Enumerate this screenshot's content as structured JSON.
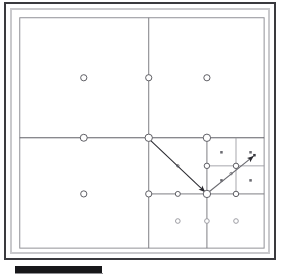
{
  "window": {
    "title": "Quadtree Mesh Refinement Viewer",
    "frame_color": "#3a3a3e",
    "inner_border_color": "#c9c9cc",
    "background_color": "#ffffff"
  },
  "scrollbar": {
    "orientation": "horizontal",
    "thumb_color": "#17171a",
    "track_color": "#ffffff",
    "thumb_position_pct": 4,
    "thumb_width_pct": 32
  },
  "diagram": {
    "type": "quadtree-mesh",
    "name": "adaptive-mesh-refinement-quadtree",
    "line_color": "#6a6a70",
    "fine_line_color": "#9a9aa0",
    "node_stroke_color": "#5a5a60",
    "node_fill_color": "#ffffff",
    "arrow_color": "#2a2a30",
    "root": {
      "x": 8,
      "y": 8,
      "width": 252,
      "height": 238
    },
    "split_lines": [
      {
        "name": "root-vertical-midline",
        "x1": 141,
        "y1": 8,
        "x2": 141,
        "y2": 246
      },
      {
        "name": "root-horizontal-midline",
        "x1": 8,
        "y1": 132,
        "x2": 260,
        "y2": 132
      },
      {
        "name": "q4-vertical-midline",
        "x1": 201,
        "y1": 132,
        "x2": 201,
        "y2": 246
      },
      {
        "name": "q4-horizontal-midline",
        "x1": 141,
        "y1": 190,
        "x2": 260,
        "y2": 190
      },
      {
        "name": "q4a-vertical-midline",
        "x1": 231,
        "y1": 132,
        "x2": 231,
        "y2": 190
      },
      {
        "name": "q4a-horizontal-midline",
        "x1": 201,
        "y1": 161,
        "x2": 260,
        "y2": 161
      }
    ],
    "circle_nodes": [
      {
        "name": "q1-center-node",
        "x": 74,
        "y": 70,
        "r": 3.2
      },
      {
        "name": "q2-center-node",
        "x": 201,
        "y": 70,
        "r": 3.2
      },
      {
        "name": "q3-center-node",
        "x": 74,
        "y": 190,
        "r": 3.2
      },
      {
        "name": "top-edge-hanging-node",
        "x": 141,
        "y": 70,
        "r": 3.2
      },
      {
        "name": "left-edge-hanging-node",
        "x": 74,
        "y": 132,
        "r": 3.6
      },
      {
        "name": "root-center-node",
        "x": 141,
        "y": 132,
        "r": 3.8
      },
      {
        "name": "q2-bottom-hanging-node",
        "x": 201,
        "y": 132,
        "r": 3.8
      },
      {
        "name": "q3-right-hanging-node",
        "x": 141,
        "y": 190,
        "r": 3.2
      },
      {
        "name": "q4-left-edge-node",
        "x": 171,
        "y": 190,
        "r": 2.6
      },
      {
        "name": "q4-center-node",
        "x": 201,
        "y": 190,
        "r": 3.8
      },
      {
        "name": "q4a-center-node",
        "x": 231,
        "y": 161,
        "r": 2.8
      },
      {
        "name": "q4a-left-node",
        "x": 201,
        "y": 161,
        "r": 2.8
      },
      {
        "name": "q4d-top-node",
        "x": 231,
        "y": 190,
        "r": 2.8
      },
      {
        "name": "q4c-center-node",
        "x": 171,
        "y": 218,
        "r": 2.4
      },
      {
        "name": "q4d-center-node",
        "x": 201,
        "y": 218,
        "r": 2.4
      },
      {
        "name": "q4e-center-node",
        "x": 231,
        "y": 218,
        "r": 2.4
      }
    ],
    "square_nodes": [
      {
        "name": "leaf-cell-center-nw",
        "x": 216,
        "y": 147
      },
      {
        "name": "leaf-cell-center-ne",
        "x": 246,
        "y": 147
      },
      {
        "name": "leaf-cell-center-sw",
        "x": 216,
        "y": 176
      },
      {
        "name": "leaf-cell-center-se",
        "x": 246,
        "y": 176
      },
      {
        "name": "arrow-target-marker",
        "x": 250,
        "y": 150
      }
    ],
    "arrows": [
      {
        "name": "parent-to-child-arrow",
        "x1": 141,
        "y1": 133,
        "x2": 200,
        "y2": 189,
        "midpoint_marker": true,
        "head_at": "end"
      },
      {
        "name": "child-to-leaf-arrow",
        "x1": 202,
        "y1": 189,
        "x2": 250,
        "y2": 150,
        "midpoint_marker": true,
        "head_at": "end"
      }
    ]
  }
}
